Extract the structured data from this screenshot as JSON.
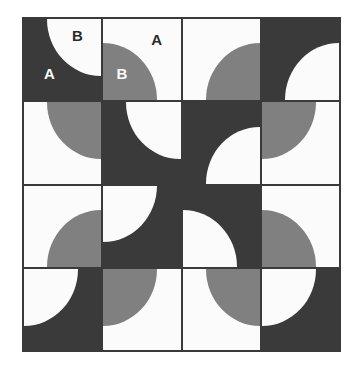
{
  "figure": {
    "name": "two-tile-quarter-circle-tiling",
    "type": "geometric-tiling-pattern",
    "rows": 4,
    "columns": 4,
    "colors": {
      "dark": "#3a3a3a",
      "gray": "#808080",
      "white": "#fbfbfb",
      "border": "#3a3a3a",
      "page_background": "#ffffff"
    },
    "tiles": [
      {
        "row": 0,
        "col": 0,
        "background": "dark",
        "quarter_color": "white",
        "quarter_corner": "tr"
      },
      {
        "row": 0,
        "col": 1,
        "background": "white",
        "quarter_color": "gray",
        "quarter_corner": "bl"
      },
      {
        "row": 0,
        "col": 2,
        "background": "white",
        "quarter_color": "gray",
        "quarter_corner": "br"
      },
      {
        "row": 0,
        "col": 3,
        "background": "dark",
        "quarter_color": "white",
        "quarter_corner": "br"
      },
      {
        "row": 1,
        "col": 0,
        "background": "white",
        "quarter_color": "gray",
        "quarter_corner": "tr"
      },
      {
        "row": 1,
        "col": 1,
        "background": "dark",
        "quarter_color": "white",
        "quarter_corner": "tr"
      },
      {
        "row": 1,
        "col": 2,
        "background": "dark",
        "quarter_color": "white",
        "quarter_corner": "br"
      },
      {
        "row": 1,
        "col": 3,
        "background": "white",
        "quarter_color": "gray",
        "quarter_corner": "tl"
      },
      {
        "row": 2,
        "col": 0,
        "background": "white",
        "quarter_color": "gray",
        "quarter_corner": "br"
      },
      {
        "row": 2,
        "col": 1,
        "background": "dark",
        "quarter_color": "white",
        "quarter_corner": "tl"
      },
      {
        "row": 2,
        "col": 2,
        "background": "dark",
        "quarter_color": "white",
        "quarter_corner": "bl"
      },
      {
        "row": 2,
        "col": 3,
        "background": "white",
        "quarter_color": "gray",
        "quarter_corner": "bl"
      },
      {
        "row": 3,
        "col": 0,
        "background": "dark",
        "quarter_color": "white",
        "quarter_corner": "tl"
      },
      {
        "row": 3,
        "col": 1,
        "background": "white",
        "quarter_color": "gray",
        "quarter_corner": "tl"
      },
      {
        "row": 3,
        "col": 2,
        "background": "white",
        "quarter_color": "gray",
        "quarter_corner": "tr"
      },
      {
        "row": 3,
        "col": 3,
        "background": "dark",
        "quarter_color": "white",
        "quarter_corner": "tl"
      }
    ],
    "labels": [
      {
        "id": "label-a-1",
        "text": "A",
        "row": 0,
        "col": 0,
        "left_pct": 26,
        "top_pct": 58,
        "color": "#fbfbfb"
      },
      {
        "id": "label-b-1",
        "text": "B",
        "row": 0,
        "col": 0,
        "left_pct": 62,
        "top_pct": 11,
        "color": "#2a2a2a"
      },
      {
        "id": "label-a-2",
        "text": "A",
        "row": 0,
        "col": 1,
        "left_pct": 62,
        "top_pct": 16,
        "color": "#2a2a2a"
      },
      {
        "id": "label-b-2",
        "text": "B",
        "row": 0,
        "col": 1,
        "left_pct": 17,
        "top_pct": 58,
        "color": "#fbfbfb"
      }
    ]
  }
}
